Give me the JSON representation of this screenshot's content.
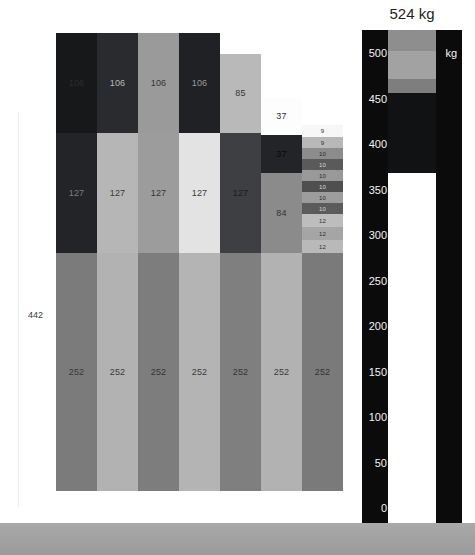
{
  "chart_data": {
    "type": "bar",
    "title": "",
    "xlabel": "",
    "ylabel": "",
    "stacked": true,
    "grid": false,
    "legend": "none",
    "total_label": "442",
    "categories": [
      "1",
      "2",
      "3",
      "4",
      "5",
      "6",
      "7"
    ],
    "series": [
      {
        "name": "bottom",
        "values": [
          252,
          252,
          252,
          252,
          252,
          252,
          252
        ]
      },
      {
        "name": "middle",
        "values": [
          127,
          127,
          127,
          127,
          127,
          84,
          null
        ]
      },
      {
        "name": "upper",
        "values": [
          106,
          106,
          106,
          106,
          85,
          37,
          null
        ]
      },
      {
        "name": "top",
        "values": [
          null,
          null,
          null,
          null,
          null,
          37,
          null
        ]
      }
    ],
    "column_stacks": [
      {
        "id": "col-1",
        "segments": [
          {
            "value": "106",
            "height": 100,
            "color": "#17181a",
            "text_color": "#2d2d2f"
          },
          {
            "value": "127",
            "height": 120,
            "color": "#232427",
            "text_color": "#7d7d80"
          },
          {
            "value": "252",
            "height": 238,
            "color": "#7b7b7b",
            "text_color": "#383838"
          }
        ]
      },
      {
        "id": "col-2",
        "segments": [
          {
            "value": "106",
            "height": 100,
            "color": "#2a2b2e",
            "text_color": "#b9b9bb"
          },
          {
            "value": "127",
            "height": 120,
            "color": "#b6b6b6",
            "text_color": "#393939"
          },
          {
            "value": "252",
            "height": 238,
            "color": "#b2b2b2",
            "text_color": "#3a3a3a"
          }
        ]
      },
      {
        "id": "col-3",
        "segments": [
          {
            "value": "106",
            "height": 100,
            "color": "#9a9a9a",
            "text_color": "#343434"
          },
          {
            "value": "127",
            "height": 120,
            "color": "#9c9c9c",
            "text_color": "#343434"
          },
          {
            "value": "252",
            "height": 238,
            "color": "#7d7d7d",
            "text_color": "#333333"
          }
        ]
      },
      {
        "id": "col-4",
        "segments": [
          {
            "value": "106",
            "height": 100,
            "color": "#202124",
            "text_color": "#9b9b9d"
          },
          {
            "value": "127",
            "height": 120,
            "color": "#e3e3e3",
            "text_color": "#3a3a3a"
          },
          {
            "value": "252",
            "height": 238,
            "color": "#b4b4b4",
            "text_color": "#3b3b3b"
          }
        ]
      },
      {
        "id": "col-5",
        "segments": [
          {
            "value": "85",
            "height": 79,
            "color": "#b9b9b9",
            "text_color": "#353535"
          },
          {
            "value": "127",
            "height": 120,
            "color": "#3e3f42",
            "text_color": "#1b1b1c"
          },
          {
            "value": "252",
            "height": 238,
            "color": "#7f7f7f",
            "text_color": "#343434"
          }
        ]
      },
      {
        "id": "col-6",
        "segments": [
          {
            "value": "37",
            "height": 37,
            "color": "#fdfdfd",
            "text_color": "#2e2e2e"
          },
          {
            "value": "37",
            "height": 38,
            "color": "#232427",
            "text_color": "#090909"
          },
          {
            "value": "84",
            "height": 80,
            "color": "#8b8b8b",
            "text_color": "#333333"
          },
          {
            "value": "252",
            "height": 238,
            "color": "#b2b2b2",
            "text_color": "#3b3b3b"
          }
        ]
      },
      {
        "id": "col-7",
        "segments": [
          {
            "value": "9",
            "height": 12,
            "color": "#f7f7f7",
            "text_color": "#2f2f2f"
          },
          {
            "value": "9",
            "height": 11,
            "color": "#b8b8b8",
            "text_color": "#2f2f2f"
          },
          {
            "value": "10",
            "height": 11,
            "color": "#8c8c8c",
            "text_color": "#2a2a2a"
          },
          {
            "value": "10",
            "height": 11,
            "color": "#5a5a5a",
            "text_color": "#d8d8d8"
          },
          {
            "value": "10",
            "height": 11,
            "color": "#999999",
            "text_color": "#2a2a2a"
          },
          {
            "value": "10",
            "height": 11,
            "color": "#4f4f4f",
            "text_color": "#d8d8d8"
          },
          {
            "value": "10",
            "height": 11,
            "color": "#9d9d9d",
            "text_color": "#2a2a2a"
          },
          {
            "value": "10",
            "height": 11,
            "color": "#5b5b5b",
            "text_color": "#d4d4d4"
          },
          {
            "value": "12",
            "height": 13,
            "color": "#bdbdbd",
            "text_color": "#2e2e2e"
          },
          {
            "value": "12",
            "height": 13,
            "color": "#a5a5a5",
            "text_color": "#2d2d2d"
          },
          {
            "value": "12",
            "height": 13,
            "color": "#b9b9b9",
            "text_color": "#2e2e2e"
          },
          {
            "value": "252",
            "height": 238,
            "color": "#7a7a7a",
            "text_color": "#333333"
          }
        ]
      }
    ]
  },
  "gauge": {
    "title": "524 kg",
    "unit_label": "kg",
    "axis_min": 0,
    "axis_max": 500,
    "axis_step": 50,
    "ticks": [
      "500",
      "450",
      "400",
      "350",
      "300",
      "250",
      "200",
      "150",
      "100",
      "50",
      "0"
    ],
    "value": 524,
    "fill_segments": [
      {
        "name": "segment-upper",
        "color": "#8e8e8e",
        "top_pct": 0.0,
        "height_pct": 4.2
      },
      {
        "name": "segment-mid",
        "color": "#a2a2a2",
        "top_pct": 4.2,
        "height_pct": 5.6
      },
      {
        "name": "segment-lower",
        "color": "#7e7e7e",
        "top_pct": 9.8,
        "height_pct": 3.0
      },
      {
        "name": "segment-dark",
        "color": "#111214",
        "top_pct": 12.8,
        "height_pct": 16.0
      }
    ],
    "track_color": "#ffffff",
    "frame_color": "#0b0b0b",
    "tick_text_color": "#f2f2f2"
  },
  "scene": {
    "ground_color": "#a6a6a6",
    "background_color": "#ffffff"
  }
}
